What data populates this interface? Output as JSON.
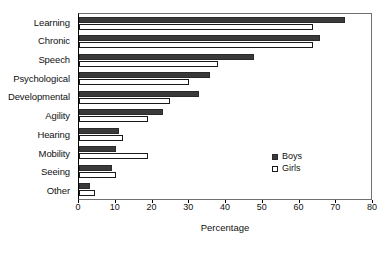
{
  "chart_data": {
    "type": "bar",
    "orientation": "horizontal",
    "title": "",
    "xlabel": "Percentage",
    "ylabel": "",
    "xlim": [
      0,
      80
    ],
    "xticks": [
      0,
      10,
      20,
      30,
      40,
      50,
      60,
      70,
      80
    ],
    "grid": false,
    "legend_position": "inside-right",
    "categories": [
      "Learning",
      "Chronic",
      "Speech",
      "Psychological",
      "Developmental",
      "Agility",
      "Hearing",
      "Mobility",
      "Seeing",
      "Other"
    ],
    "series": [
      {
        "name": "Boys",
        "color": "#3a3a3a",
        "values": [
          73,
          66,
          48,
          36,
          33,
          23,
          11,
          10,
          9,
          3
        ]
      },
      {
        "name": "Girls",
        "color": "#ffffff",
        "values": [
          64,
          64,
          38,
          30,
          25,
          19,
          12,
          19,
          10,
          4.5
        ]
      }
    ]
  },
  "legend": {
    "items": [
      {
        "label": "Boys"
      },
      {
        "label": "Girls"
      }
    ]
  },
  "axis": {
    "x_title": "Percentage",
    "tick_labels": [
      "0",
      "10",
      "20",
      "30",
      "40",
      "50",
      "60",
      "70",
      "80"
    ]
  }
}
